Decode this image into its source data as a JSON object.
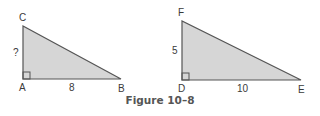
{
  "figure": {
    "caption": "Figure 10–8",
    "fill_color": "#d6d6d6",
    "stroke_color": "#555555",
    "triangles": [
      {
        "name": "ABC",
        "vertices": {
          "A": "A",
          "B": "B",
          "C": "C"
        },
        "right_angle_at": "A",
        "sides": {
          "AC": "?",
          "AB": "8"
        }
      },
      {
        "name": "DEF",
        "vertices": {
          "D": "D",
          "E": "E",
          "F": "F"
        },
        "right_angle_at": "D",
        "sides": {
          "DF": "5",
          "DE": "10"
        }
      }
    ]
  }
}
